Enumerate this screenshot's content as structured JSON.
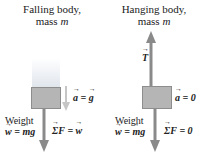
{
  "left": {
    "title_line1": "Falling body,",
    "title_line2_prefix": "mass ",
    "title_line2_var": "m",
    "accel_label": "a = g",
    "accel_lhs": "a",
    "accel_rhs": "g",
    "net_force_lhs": "ΣF",
    "net_force_rhs": "w",
    "weight_label": "Weight",
    "weight_lhs": "w",
    "weight_rhs": "mg"
  },
  "right": {
    "title_line1": "Hanging body,",
    "title_line2_prefix": "mass ",
    "title_line2_var": "m",
    "tension_label": "T",
    "accel_lhs": "a",
    "accel_rhs": "0",
    "net_force_lhs": "ΣF",
    "net_force_rhs": "0",
    "weight_label": "Weight",
    "weight_lhs": "w",
    "weight_rhs": "mg"
  },
  "colors": {
    "box_fill": "#b5b5b5",
    "arrow_dark": "#8a8a8a",
    "arrow_light": "#c6c6c6",
    "text": "#222222"
  }
}
